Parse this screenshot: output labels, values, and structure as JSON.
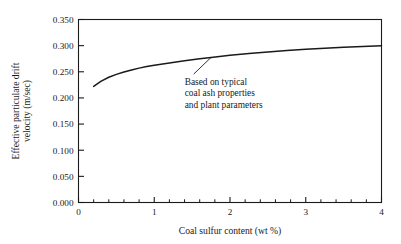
{
  "chart_data": {
    "type": "line",
    "title": "",
    "xlabel": "Coal sulfur content (wt %)",
    "ylabel_line1": "Effective particulate drift",
    "ylabel_line2": "velocity (m/sec)",
    "xlim": [
      0,
      4
    ],
    "ylim": [
      0.0,
      0.35
    ],
    "grid": false,
    "legend": null,
    "x_ticks": [
      "0",
      "1",
      "2",
      "3",
      "4"
    ],
    "x_tick_values": [
      0,
      1,
      2,
      3,
      4
    ],
    "x_minor_step": 0.2,
    "y_ticks": [
      "0.000",
      "0.050",
      "0.100",
      "0.150",
      "0.200",
      "0.250",
      "0.300",
      "0.350"
    ],
    "y_tick_values": [
      0.0,
      0.05,
      0.1,
      0.15,
      0.2,
      0.25,
      0.3,
      0.35
    ],
    "series": [
      {
        "name": "Effective particulate drift velocity",
        "color": "#1a1a1a",
        "x": [
          0.2,
          0.3,
          0.4,
          0.5,
          0.6,
          0.7,
          0.8,
          0.9,
          1.0,
          1.2,
          1.4,
          1.6,
          1.75,
          2.0,
          2.25,
          2.5,
          2.75,
          3.0,
          3.25,
          3.5,
          3.75,
          4.0
        ],
        "y": [
          0.222,
          0.232,
          0.2395,
          0.245,
          0.2495,
          0.2535,
          0.257,
          0.26,
          0.2625,
          0.267,
          0.271,
          0.275,
          0.2775,
          0.2815,
          0.285,
          0.288,
          0.2905,
          0.293,
          0.295,
          0.2968,
          0.2985,
          0.3
        ]
      }
    ],
    "annotations": [
      {
        "name": "curve-note",
        "lines": [
          "Based on typical",
          "coal ash properties",
          "and plant parameters"
        ],
        "leader_from_x": 1.75,
        "leader_from_y": 0.2775,
        "leader_to_x": 1.52,
        "leader_to_y": 0.2455
      }
    ]
  },
  "style": {
    "axis_color": "#1a1a1a",
    "curve_color": "#1a1a1a",
    "background": "#ffffff"
  }
}
